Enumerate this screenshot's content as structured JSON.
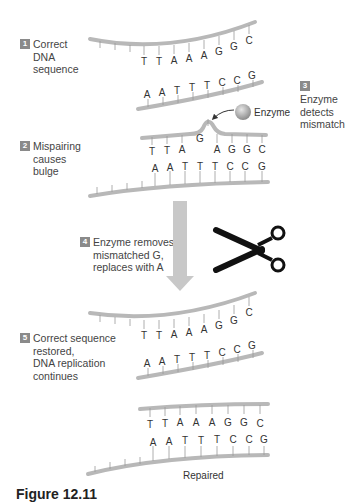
{
  "steps": [
    {
      "number": "1",
      "lines": [
        "Correct",
        "DNA",
        "sequence"
      ]
    },
    {
      "number": "2",
      "lines": [
        "Mispairing",
        "causes",
        "bulge"
      ]
    },
    {
      "number": "3",
      "lines": [
        "Enzyme",
        "detects",
        "mismatch"
      ]
    },
    {
      "number": "4",
      "lines": [
        "Enzyme removes",
        "mismatched G,",
        "replaces with A"
      ]
    },
    {
      "number": "5",
      "lines": [
        "Correct sequence",
        "restored,",
        "DNA replication",
        "continues"
      ]
    }
  ],
  "strands": {
    "panel1": {
      "top": [
        "T",
        "T",
        "A",
        "A",
        "A",
        "G",
        "G",
        "C"
      ],
      "bottom": [
        "A",
        "A",
        "T",
        "T",
        "T",
        "C",
        "C",
        "G"
      ]
    },
    "panel2": {
      "top": [
        "T",
        "T",
        "A",
        "G",
        "A",
        "G",
        "G",
        "C"
      ],
      "bottom": [
        "A",
        "A",
        "T",
        "T",
        "T",
        "C",
        "C",
        "G"
      ],
      "mismatch": "G"
    },
    "panel3": {
      "top": [
        "T",
        "T",
        "A",
        "A",
        "A",
        "G",
        "G",
        "C"
      ],
      "bottom": [
        "A",
        "A",
        "T",
        "T",
        "T",
        "C",
        "C",
        "G"
      ]
    },
    "panel4": {
      "top": [
        "T",
        "T",
        "A",
        "A",
        "A",
        "G",
        "G",
        "C"
      ],
      "bottom": [
        "A",
        "A",
        "T",
        "T",
        "T",
        "C",
        "C",
        "G"
      ]
    }
  },
  "labels": {
    "enzyme": "Enzyme",
    "repaired": "Repaired",
    "caption": "Figure 12.11"
  },
  "icons": {
    "scissors": "scissors-icon",
    "enzyme": "enzyme-sphere-icon",
    "arrow": "down-arrow-icon"
  },
  "colors": {
    "strand": "#b8b8b8",
    "badge": "#8a8a8a",
    "arrow": "#c8c8c8",
    "text": "#444444"
  }
}
